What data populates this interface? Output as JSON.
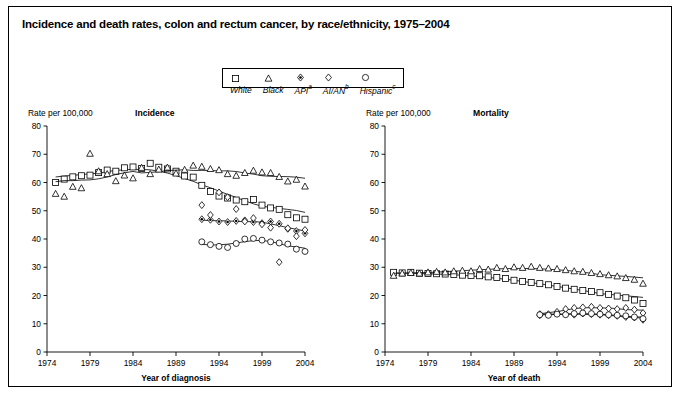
{
  "title": "Incidence and death rates, colon and rectum cancer, by race/ethnicity, 1975–2004",
  "legend": {
    "items": [
      {
        "label": "White",
        "sup": "",
        "marker": "square",
        "name": "white"
      },
      {
        "label": "Black",
        "sup": "",
        "marker": "triangle",
        "name": "black"
      },
      {
        "label": "API",
        "sup": "a",
        "marker": "diamond-filled",
        "name": "api"
      },
      {
        "label": "AI/AN",
        "sup": "b",
        "marker": "diamond",
        "name": "aian"
      },
      {
        "label": "Hispanic",
        "sup": "c",
        "marker": "circle",
        "name": "hispanic"
      }
    ]
  },
  "chart_data": [
    {
      "type": "scatter",
      "title": "Incidence",
      "ylabel": "Rate per 100,000",
      "xlabel": "Year of diagnosis",
      "ylim": [
        0,
        80
      ],
      "yticks": [
        0,
        10,
        20,
        30,
        40,
        50,
        60,
        70,
        80
      ],
      "xlim": [
        1974,
        2004
      ],
      "xticks": [
        1974,
        1979,
        1984,
        1989,
        1994,
        1999,
        2004
      ],
      "grid": false,
      "series": [
        {
          "name": "White",
          "marker": "square",
          "trend": true,
          "x": [
            1975,
            1976,
            1977,
            1978,
            1979,
            1980,
            1981,
            1982,
            1983,
            1984,
            1985,
            1986,
            1987,
            1988,
            1989,
            1990,
            1991,
            1992,
            1993,
            1994,
            1995,
            1996,
            1997,
            1998,
            1999,
            2000,
            2001,
            2002,
            2003,
            2004
          ],
          "y": [
            60.0,
            61.2,
            62.0,
            62.4,
            62.6,
            63.5,
            64.4,
            64.0,
            65.2,
            65.5,
            65.0,
            66.8,
            65.4,
            64.8,
            64.0,
            62.3,
            61.9,
            59.0,
            56.8,
            55.2,
            54.5,
            53.8,
            53.2,
            54.0,
            52.0,
            51.0,
            50.5,
            48.6,
            47.5,
            47.0
          ]
        },
        {
          "name": "Black",
          "marker": "triangle",
          "trend": true,
          "x": [
            1975,
            1976,
            1977,
            1978,
            1979,
            1980,
            1981,
            1982,
            1983,
            1984,
            1985,
            1986,
            1987,
            1988,
            1989,
            1990,
            1991,
            1992,
            1993,
            1994,
            1995,
            1996,
            1997,
            1998,
            1999,
            2000,
            2001,
            2002,
            2003,
            2004
          ],
          "y": [
            56.0,
            55.0,
            58.5,
            58.0,
            70.2,
            64.0,
            63.0,
            60.5,
            62.5,
            61.5,
            65.2,
            63.0,
            64.6,
            65.3,
            63.2,
            64.5,
            66.0,
            65.6,
            64.8,
            64.4,
            63.0,
            62.4,
            63.4,
            64.2,
            63.6,
            63.4,
            62.0,
            60.4,
            61.0,
            58.6
          ]
        },
        {
          "name": "API",
          "marker": "diamond-filled",
          "trend": true,
          "x": [
            1992,
            1993,
            1994,
            1995,
            1996,
            1997,
            1998,
            1999,
            2000,
            2001,
            2002,
            2003,
            2004
          ],
          "y": [
            47.0,
            46.8,
            46.2,
            46.0,
            46.4,
            46.6,
            46.0,
            45.6,
            46.2,
            45.4,
            43.6,
            42.8,
            42.0
          ]
        },
        {
          "name": "AI/AN",
          "marker": "diamond",
          "trend": false,
          "x": [
            1992,
            1993,
            1994,
            1995,
            1996,
            1997,
            1998,
            1999,
            2000,
            2001,
            2002,
            2003,
            2004
          ],
          "y": [
            52.0,
            48.5,
            56.5,
            54.8,
            50.6,
            46.2,
            47.4,
            45.2,
            44.0,
            31.8,
            43.8,
            41.0,
            43.2
          ]
        },
        {
          "name": "Hispanic",
          "marker": "circle",
          "trend": true,
          "x": [
            1992,
            1993,
            1994,
            1995,
            1996,
            1997,
            1998,
            1999,
            2000,
            2001,
            2002,
            2003,
            2004
          ],
          "y": [
            39.0,
            38.0,
            37.4,
            37.0,
            38.4,
            40.0,
            40.2,
            39.6,
            39.0,
            38.6,
            38.2,
            36.4,
            35.6
          ]
        }
      ]
    },
    {
      "type": "scatter",
      "title": "Mortality",
      "ylabel": "Rate per 100,000",
      "xlabel": "Year of death",
      "ylim": [
        0,
        80
      ],
      "yticks": [
        0,
        10,
        20,
        30,
        40,
        50,
        60,
        70,
        80
      ],
      "xlim": [
        1974,
        2004
      ],
      "xticks": [
        1974,
        1979,
        1984,
        1989,
        1994,
        1999,
        2004
      ],
      "grid": false,
      "series": [
        {
          "name": "White",
          "marker": "square",
          "trend": true,
          "x": [
            1975,
            1976,
            1977,
            1978,
            1979,
            1980,
            1981,
            1982,
            1983,
            1984,
            1985,
            1986,
            1987,
            1988,
            1989,
            1990,
            1991,
            1992,
            1993,
            1994,
            1995,
            1996,
            1997,
            1998,
            1999,
            2000,
            2001,
            2002,
            2003,
            2004
          ],
          "y": [
            28.2,
            28.0,
            28.2,
            27.9,
            27.8,
            27.7,
            27.6,
            27.4,
            27.2,
            27.1,
            27.0,
            26.6,
            26.4,
            26.0,
            25.4,
            25.0,
            24.6,
            24.2,
            23.8,
            23.2,
            22.6,
            22.2,
            21.8,
            21.4,
            21.0,
            20.4,
            19.8,
            19.2,
            18.4,
            17.2
          ]
        },
        {
          "name": "Black",
          "marker": "triangle",
          "trend": true,
          "x": [
            1975,
            1976,
            1977,
            1978,
            1979,
            1980,
            1981,
            1982,
            1983,
            1984,
            1985,
            1986,
            1987,
            1988,
            1989,
            1990,
            1991,
            1992,
            1993,
            1994,
            1995,
            1996,
            1997,
            1998,
            1999,
            2000,
            2001,
            2002,
            2003,
            2004
          ],
          "y": [
            27.0,
            27.8,
            28.0,
            27.8,
            28.2,
            28.4,
            28.2,
            28.6,
            28.8,
            28.6,
            29.4,
            29.2,
            29.8,
            29.4,
            30.0,
            29.8,
            30.2,
            29.8,
            29.6,
            29.4,
            29.0,
            28.6,
            28.4,
            28.0,
            27.6,
            27.2,
            26.8,
            26.2,
            25.6,
            24.2
          ]
        },
        {
          "name": "API",
          "marker": "diamond-filled",
          "trend": true,
          "x": [
            1992,
            1993,
            1994,
            1995,
            1996,
            1997,
            1998,
            1999,
            2000,
            2001,
            2002,
            2003,
            2004
          ],
          "y": [
            13.4,
            13.2,
            13.6,
            13.4,
            13.2,
            13.6,
            13.4,
            13.2,
            13.0,
            12.8,
            12.4,
            12.2,
            11.4
          ]
        },
        {
          "name": "AI/AN",
          "marker": "diamond",
          "trend": true,
          "x": [
            1992,
            1993,
            1994,
            1995,
            1996,
            1997,
            1998,
            1999,
            2000,
            2001,
            2002,
            2003,
            2004
          ],
          "y": [
            13.0,
            13.4,
            14.2,
            15.2,
            15.6,
            15.8,
            16.0,
            15.6,
            15.4,
            15.2,
            15.6,
            15.0,
            13.8
          ]
        },
        {
          "name": "Hispanic",
          "marker": "circle",
          "trend": true,
          "x": [
            1992,
            1993,
            1994,
            1995,
            1996,
            1997,
            1998,
            1999,
            2000,
            2001,
            2002,
            2003,
            2004
          ],
          "y": [
            13.2,
            13.0,
            13.4,
            13.2,
            13.6,
            13.8,
            13.6,
            13.4,
            13.2,
            13.0,
            12.8,
            12.4,
            11.8
          ]
        }
      ]
    }
  ]
}
